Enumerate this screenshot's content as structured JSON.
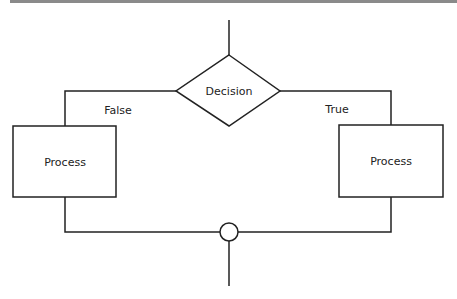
{
  "diagram": {
    "type": "flowchart",
    "nodes": [
      {
        "id": "decision",
        "shape": "diamond",
        "label": "Decision"
      },
      {
        "id": "process_false",
        "shape": "rectangle",
        "label": "Process"
      },
      {
        "id": "process_true",
        "shape": "rectangle",
        "label": "Process"
      },
      {
        "id": "merge",
        "shape": "circle",
        "label": ""
      }
    ],
    "edges": [
      {
        "from": "decision",
        "to": "process_false",
        "label": "False"
      },
      {
        "from": "decision",
        "to": "process_true",
        "label": "True"
      },
      {
        "from": "process_false",
        "to": "merge",
        "label": ""
      },
      {
        "from": "process_true",
        "to": "merge",
        "label": ""
      }
    ],
    "labels": {
      "decision": "Decision",
      "process_left": "Process",
      "process_right": "Process",
      "false_branch": "False",
      "true_branch": "True"
    },
    "colors": {
      "stroke": "#222222",
      "fill": "#ffffff",
      "top_rule": "#8a8a8a"
    }
  }
}
